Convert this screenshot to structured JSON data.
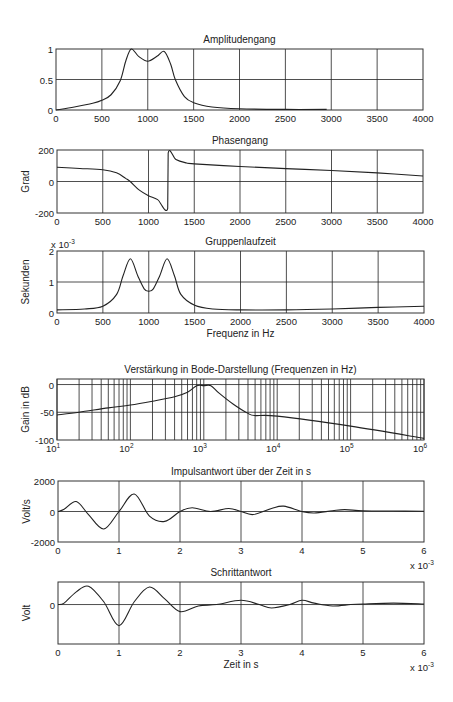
{
  "chart_data": [
    {
      "type": "line",
      "title": "Amplitudengang",
      "xlabel": "",
      "ylabel": "",
      "xlim": [
        0,
        4000
      ],
      "ylim": [
        0,
        1
      ],
      "xticks": [
        "0",
        "500",
        "1000",
        "1500",
        "2000",
        "2500",
        "3000",
        "3500",
        "4000"
      ],
      "yticks": [
        "0",
        "0.5",
        "1"
      ],
      "grid": true,
      "x": [
        0,
        200,
        400,
        500,
        600,
        700,
        760,
        820,
        900,
        1000,
        1100,
        1180,
        1250,
        1300,
        1400,
        1500,
        1700,
        2000,
        2500,
        2950
      ],
      "values": [
        0,
        0.05,
        0.11,
        0.16,
        0.25,
        0.48,
        0.8,
        1.0,
        0.88,
        0.8,
        0.88,
        0.96,
        0.75,
        0.5,
        0.22,
        0.12,
        0.05,
        0.02,
        0.01,
        0.01
      ]
    },
    {
      "type": "line",
      "title": "Phasengang",
      "xlabel": "",
      "ylabel": "Grad",
      "xlim": [
        0,
        4000
      ],
      "ylim": [
        -200,
        200
      ],
      "xticks": [
        "0",
        "500",
        "1000",
        "1500",
        "2000",
        "2500",
        "3000",
        "3500",
        "4000"
      ],
      "yticks": [
        "-200",
        "0",
        "200"
      ],
      "grid": true,
      "x": [
        0,
        250,
        500,
        650,
        750,
        800,
        900,
        1000,
        1100,
        1210,
        1215,
        1300,
        1400,
        1500,
        2000,
        2500,
        3000,
        3500,
        4000
      ],
      "values": [
        90,
        83,
        75,
        55,
        20,
        0,
        -55,
        -90,
        -115,
        -170,
        180,
        140,
        120,
        112,
        95,
        82,
        70,
        55,
        35
      ]
    },
    {
      "type": "line",
      "title": "Gruppenlaufzeit",
      "xlabel": "Frequenz in Hz",
      "ylabel": "Sekunden",
      "scale_note": "x 10^-3",
      "xlim": [
        0,
        4000
      ],
      "ylim": [
        0,
        0.002
      ],
      "xticks": [
        "0",
        "500",
        "1000",
        "1500",
        "2000",
        "2500",
        "3000",
        "3500",
        "4000"
      ],
      "yticks": [
        "0",
        "1",
        "2"
      ],
      "grid": true,
      "x": [
        0,
        300,
        500,
        650,
        720,
        800,
        880,
        950,
        1000,
        1050,
        1120,
        1200,
        1280,
        1350,
        1500,
        1700,
        2000,
        2500,
        3000,
        3500,
        4000
      ],
      "values": [
        0.0001,
        0.00013,
        0.00022,
        0.0006,
        0.0012,
        0.00175,
        0.0012,
        0.00078,
        0.0007,
        0.00078,
        0.0012,
        0.00175,
        0.0012,
        0.0006,
        0.00025,
        0.00013,
        0.0001,
        0.0001,
        0.00013,
        0.00018,
        0.00022
      ]
    },
    {
      "type": "line",
      "title": "Verstärkung in Bode-Darstellung (Frequenzen in Hz)",
      "xlabel": "",
      "ylabel": "Gain in dB",
      "xscale": "log",
      "xlim": [
        10,
        1000000
      ],
      "ylim": [
        -100,
        10
      ],
      "xticks": [
        "10^1",
        "10^2",
        "10^3",
        "10^4",
        "10^5",
        "10^6"
      ],
      "yticks": [
        "-100",
        "-50",
        "0"
      ],
      "grid": true,
      "x": [
        10,
        20,
        50,
        100,
        200,
        400,
        600,
        800,
        1000,
        1250,
        1600,
        2500,
        4000,
        5000,
        10000,
        100000,
        1000000
      ],
      "values": [
        -55,
        -50,
        -42,
        -37,
        -30,
        -22,
        -14,
        -2,
        -2,
        -2,
        -15,
        -35,
        -52,
        -56,
        -57,
        -75,
        -97
      ]
    },
    {
      "type": "line",
      "title": "Impulsantwort über der Zeit in s",
      "xlabel": "",
      "ylabel": "Volt/s",
      "scale_note": "x 10^-3",
      "xlim": [
        0,
        0.006
      ],
      "ylim": [
        -2000,
        2000
      ],
      "xticks": [
        "0",
        "1",
        "2",
        "3",
        "4",
        "5",
        "6"
      ],
      "yticks": [
        "-2000",
        "0",
        "2000"
      ],
      "grid": true,
      "x": [
        0,
        0.0001,
        0.0003,
        0.0005,
        0.00075,
        0.001,
        0.00125,
        0.0015,
        0.00175,
        0.002,
        0.0022,
        0.0025,
        0.0028,
        0.003,
        0.0032,
        0.0035,
        0.0037,
        0.004,
        0.0042,
        0.0045,
        0.0047,
        0.005,
        0.0055,
        0.006
      ],
      "values": [
        0,
        150,
        650,
        -200,
        -1150,
        0,
        1150,
        -300,
        -650,
        0,
        250,
        0,
        200,
        0,
        -200,
        200,
        350,
        0,
        -100,
        50,
        120,
        50,
        30,
        20
      ]
    },
    {
      "type": "line",
      "title": "Schrittantwort",
      "xlabel": "Zeit in s",
      "ylabel": "Volt",
      "scale_note": "x 10^-3",
      "xlim": [
        0,
        0.006
      ],
      "ylim": [
        -1.4,
        0.8
      ],
      "xticks": [
        "0",
        "1",
        "2",
        "3",
        "4",
        "5",
        "6"
      ],
      "yticks": [
        "0"
      ],
      "grid": true,
      "x": [
        0,
        0.0001,
        0.0003,
        0.0005,
        0.00075,
        0.001,
        0.00125,
        0.0015,
        0.00175,
        0.002,
        0.0023,
        0.0026,
        0.003,
        0.0033,
        0.0035,
        0.0038,
        0.004,
        0.0042,
        0.0045,
        0.0048,
        0.005,
        0.0055,
        0.006
      ],
      "values": [
        0,
        0.05,
        0.45,
        0.65,
        0.1,
        -0.75,
        0.1,
        0.62,
        0.2,
        -0.25,
        -0.05,
        0.0,
        0.15,
        0.0,
        -0.12,
        0.0,
        0.15,
        0.05,
        -0.05,
        0.0,
        0.02,
        0.05,
        0.02
      ]
    }
  ]
}
